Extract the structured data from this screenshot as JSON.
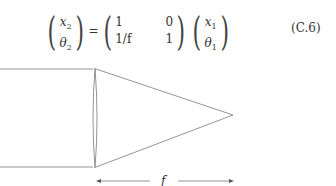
{
  "equation": {
    "lhs": {
      "top": "x",
      "top_sub": "2",
      "bottom": "θ",
      "bottom_sub": "2"
    },
    "equals": "=",
    "matrix": [
      [
        "1",
        "0"
      ],
      [
        "1/f",
        "1"
      ]
    ],
    "rhs": {
      "top": "x",
      "top_sub": "1",
      "bottom": "θ",
      "bottom_sub": "1"
    },
    "number": "(C.6)"
  },
  "diagram": {
    "focal_label": "f",
    "line_color": "#777777"
  }
}
